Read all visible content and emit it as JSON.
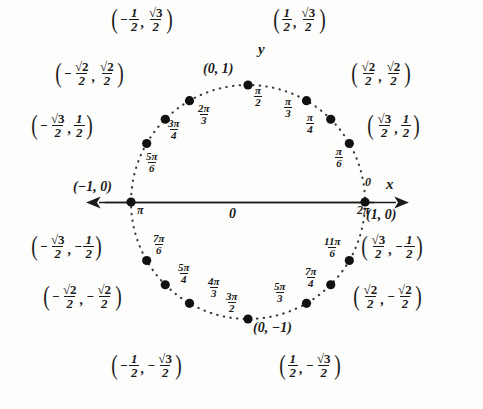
{
  "figure": {
    "type": "unit-circle-diagram",
    "background_color": "#fdfdfc",
    "ink_color": "#1a1a1a"
  },
  "axes": {
    "x_label": "x",
    "y_label": "y",
    "origin_label": "0"
  },
  "circle": {
    "center_px": [
      248,
      202
    ],
    "radius_px": 117,
    "style": "dotted"
  },
  "chart_data": {
    "type": "scatter",
    "xlabel": "x",
    "ylabel": "y",
    "xlim": [
      -1,
      1
    ],
    "ylim": [
      -1,
      1
    ],
    "grid": false,
    "legend": null,
    "points": [
      {
        "angle_deg": 0,
        "angle_label": "0",
        "angle_label2": "2π",
        "coord_label": "(1, 0)",
        "x": 1,
        "y": 0
      },
      {
        "angle_deg": 30,
        "angle_num": "π",
        "angle_den": "6",
        "coord_x_num": "√3",
        "coord_x_den": "2",
        "coord_y_num": "1",
        "coord_y_den": "2",
        "x": 0.866,
        "y": 0.5
      },
      {
        "angle_deg": 45,
        "angle_num": "π",
        "angle_den": "4",
        "coord_x_num": "√2",
        "coord_x_den": "2",
        "coord_y_num": "√2",
        "coord_y_den": "2",
        "x": 0.707,
        "y": 0.707
      },
      {
        "angle_deg": 60,
        "angle_num": "π",
        "angle_den": "3",
        "coord_x_num": "1",
        "coord_x_den": "2",
        "coord_y_num": "√3",
        "coord_y_den": "2",
        "x": 0.5,
        "y": 0.866
      },
      {
        "angle_deg": 90,
        "angle_num": "π",
        "angle_den": "2",
        "coord_label": "(0, 1)",
        "x": 0,
        "y": 1
      },
      {
        "angle_deg": 120,
        "angle_num": "2π",
        "angle_den": "3",
        "coord_x_num": "1",
        "coord_x_den": "2",
        "coord_x_sign": "−",
        "coord_y_num": "√3",
        "coord_y_den": "2",
        "x": -0.5,
        "y": 0.866
      },
      {
        "angle_deg": 135,
        "angle_num": "3π",
        "angle_den": "4",
        "coord_x_num": "√2",
        "coord_x_den": "2",
        "coord_x_sign": "−",
        "coord_y_num": "√2",
        "coord_y_den": "2",
        "x": -0.707,
        "y": 0.707
      },
      {
        "angle_deg": 150,
        "angle_num": "5π",
        "angle_den": "6",
        "coord_x_num": "√3",
        "coord_x_den": "2",
        "coord_x_sign": "−",
        "coord_y_num": "1",
        "coord_y_den": "2",
        "x": -0.866,
        "y": 0.5
      },
      {
        "angle_deg": 180,
        "angle_label": "π",
        "coord_label": "(−1, 0)",
        "x": -1,
        "y": 0
      },
      {
        "angle_deg": 210,
        "angle_num": "7π",
        "angle_den": "6",
        "coord_x_num": "√3",
        "coord_x_den": "2",
        "coord_x_sign": "−",
        "coord_y_num": "1",
        "coord_y_den": "2",
        "coord_y_sign": "−",
        "x": -0.866,
        "y": -0.5
      },
      {
        "angle_deg": 225,
        "angle_num": "5π",
        "angle_den": "4",
        "coord_x_num": "√2",
        "coord_x_den": "2",
        "coord_x_sign": "−",
        "coord_y_num": "√2",
        "coord_y_den": "2",
        "coord_y_sign": "−",
        "x": -0.707,
        "y": -0.707
      },
      {
        "angle_deg": 240,
        "angle_num": "4π",
        "angle_den": "3",
        "coord_x_num": "1",
        "coord_x_den": "2",
        "coord_x_sign": "−",
        "coord_y_num": "√3",
        "coord_y_den": "2",
        "coord_y_sign": "−",
        "x": -0.5,
        "y": -0.866
      },
      {
        "angle_deg": 270,
        "angle_num": "3π",
        "angle_den": "2",
        "coord_label": "(0, −1)",
        "x": 0,
        "y": -1
      },
      {
        "angle_deg": 300,
        "angle_num": "5π",
        "angle_den": "3",
        "coord_x_num": "1",
        "coord_x_den": "2",
        "coord_y_num": "√3",
        "coord_y_den": "2",
        "coord_y_sign": "−",
        "x": 0.5,
        "y": -0.866
      },
      {
        "angle_deg": 315,
        "angle_num": "7π",
        "angle_den": "4",
        "coord_x_num": "√2",
        "coord_x_den": "2",
        "coord_y_num": "√2",
        "coord_y_den": "2",
        "coord_y_sign": "−",
        "x": 0.707,
        "y": -0.707
      },
      {
        "angle_deg": 330,
        "angle_num": "11π",
        "angle_den": "6",
        "coord_x_num": "√3",
        "coord_x_den": "2",
        "coord_y_num": "1",
        "coord_y_den": "2",
        "coord_y_sign": "−",
        "x": 0.866,
        "y": -0.5
      }
    ]
  },
  "labels": {
    "q1_60": {
      "xn": "1",
      "xd": "2",
      "yn": "√3",
      "yd": "2"
    },
    "q1_45": {
      "xn": "√2",
      "xd": "2",
      "yn": "√2",
      "yd": "2"
    },
    "q1_30": {
      "xn": "√3",
      "xd": "2",
      "yn": "1",
      "yd": "2"
    },
    "q2_120": {
      "xn": "1",
      "xd": "2",
      "yn": "√3",
      "yd": "2",
      "xs": "−"
    },
    "q2_135": {
      "xn": "√2",
      "xd": "2",
      "yn": "√2",
      "yd": "2",
      "xs": "−"
    },
    "q2_150": {
      "xn": "√3",
      "xd": "2",
      "yn": "1",
      "yd": "2",
      "xs": "−"
    },
    "q3_210": {
      "xn": "√3",
      "xd": "2",
      "yn": "1",
      "yd": "2",
      "xs": "−",
      "ys": "−"
    },
    "q3_225": {
      "xn": "√2",
      "xd": "2",
      "yn": "√2",
      "yd": "2",
      "xs": "−",
      "ys": "−"
    },
    "q3_240": {
      "xn": "1",
      "xd": "2",
      "yn": "√3",
      "yd": "2",
      "xs": "−",
      "ys": "−"
    },
    "q4_330": {
      "xn": "√3",
      "xd": "2",
      "yn": "1",
      "yd": "2",
      "ys": "−"
    },
    "q4_315": {
      "xn": "√2",
      "xd": "2",
      "yn": "√2",
      "yd": "2",
      "ys": "−"
    },
    "q4_300": {
      "xn": "1",
      "xd": "2",
      "yn": "√3",
      "yd": "2",
      "ys": "−"
    },
    "pt_right": "(1, 0)",
    "pt_left": "(−1, 0)",
    "pt_top": "(0, 1)",
    "pt_bottom": "(0, −1)",
    "ang_0": "0",
    "ang_2pi": "2π",
    "ang_pi": "π"
  }
}
